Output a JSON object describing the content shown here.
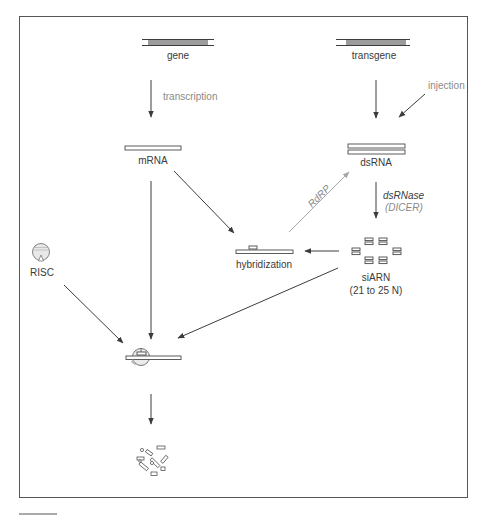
{
  "diagram": {
    "type": "RNA interference pathway",
    "nodes": {
      "gene": {
        "label": "gene"
      },
      "transgene": {
        "label": "transgene"
      },
      "mrna": {
        "label": "mRNA"
      },
      "dsrna": {
        "label": "dsRNA"
      },
      "hybridization": {
        "label": "hybridization"
      },
      "siarn": {
        "label": "siARN",
        "sublabel": "(21 to 25 N)"
      },
      "risc": {
        "label": "RISC"
      },
      "cleavage_complex": {
        "label": ""
      },
      "degradation_fragments": {
        "label": ""
      }
    },
    "edges": {
      "transcription": {
        "label": "transcription",
        "from": "gene",
        "to": "mrna"
      },
      "transgene_to_dsrna": {
        "label": "",
        "from": "transgene",
        "to": "dsrna"
      },
      "injection": {
        "label": "injection",
        "to": "dsrna"
      },
      "dicer": {
        "label": "dsRNase",
        "sublabel": "(DICER)",
        "from": "dsrna",
        "to": "siarn"
      },
      "rdrp": {
        "label": "RdRP",
        "from": "hybridization",
        "to": "dsrna"
      },
      "mrna_to_hybridization": {
        "label": "",
        "from": "mrna",
        "to": "hybridization"
      },
      "siarn_to_hybridization": {
        "label": "",
        "from": "siarn",
        "to": "hybridization"
      },
      "mrna_to_complex": {
        "label": "",
        "from": "mrna",
        "to": "cleavage_complex"
      },
      "risc_to_complex": {
        "label": "",
        "from": "risc",
        "to": "cleavage_complex"
      },
      "siarn_to_complex": {
        "label": "",
        "from": "siarn",
        "to": "cleavage_complex"
      },
      "complex_to_degradation": {
        "label": "",
        "from": "cleavage_complex",
        "to": "degradation_fragments"
      }
    },
    "colors": {
      "stroke": "#3c3c3c",
      "rdrp_arrow": "#a8a8a8",
      "dna_fill": "#9c9c9c",
      "frame": "#555555"
    }
  }
}
